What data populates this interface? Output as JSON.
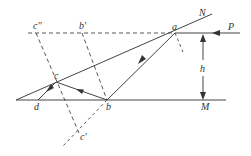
{
  "diagram": {
    "colors": {
      "line": "#444444",
      "background": "#ffffff"
    },
    "labels": {
      "c_double_prime": "c″",
      "b_prime": "b′",
      "a": "a",
      "N": "N",
      "P": "P",
      "h": "h",
      "c": "c",
      "d": "d",
      "b": "b",
      "M": "M",
      "c_prime": "c′"
    },
    "points": {
      "a": [
        175,
        33
      ],
      "b": [
        107,
        100
      ],
      "c": [
        56,
        82
      ],
      "d": [
        38,
        100
      ],
      "b_prime": [
        82,
        33
      ],
      "c_double_prime": [
        36,
        33
      ],
      "c_prime": [
        79,
        133
      ]
    },
    "lines": {
      "mirror_N": {
        "from": [
          16,
          100
        ],
        "to": [
          212,
          14
        ]
      },
      "mirror_M": {
        "from": [
          16,
          100
        ],
        "to": [
          226,
          100
        ]
      },
      "incident_P": {
        "from": [
          240,
          33
        ],
        "to": [
          175,
          33
        ]
      },
      "dashed_top": {
        "from": [
          28,
          33
        ],
        "to": [
          175,
          33
        ]
      }
    },
    "dimension": {
      "label": "h",
      "x": 203,
      "from_y": 33,
      "to_y": 100
    }
  }
}
